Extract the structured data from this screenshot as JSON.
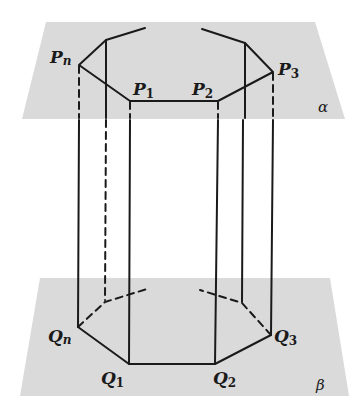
{
  "figure": {
    "colors": {
      "plane": "#d9d9d9",
      "line": "#1a1a1a",
      "background": "#ffffff"
    }
  },
  "planes": {
    "top": {
      "label": "α"
    },
    "bottom": {
      "label": "β"
    }
  },
  "top_vertices": [
    {
      "base": "P",
      "sub": "n"
    },
    {
      "base": "P",
      "sub": "1"
    },
    {
      "base": "P",
      "sub": "2"
    },
    {
      "base": "P",
      "sub": "3"
    }
  ],
  "bottom_vertices": [
    {
      "base": "Q",
      "sub": "n"
    },
    {
      "base": "Q",
      "sub": "1"
    },
    {
      "base": "Q",
      "sub": "2"
    },
    {
      "base": "Q",
      "sub": "3"
    }
  ]
}
